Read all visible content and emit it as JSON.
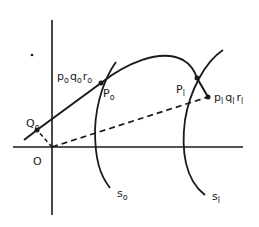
{
  "diagram": {
    "type": "geometric-construction",
    "axes": {
      "origin_label": "O"
    },
    "points": [
      {
        "id": "O",
        "label": "O",
        "x": 52,
        "y": 147
      },
      {
        "id": "Q0",
        "label": "Q",
        "sub": "o",
        "x": 37,
        "y": 130
      },
      {
        "id": "P0",
        "label": "P",
        "sub": "o",
        "x": 101,
        "y": 83
      },
      {
        "id": "P1",
        "label": "P",
        "sub": "l",
        "x": 197,
        "y": 78
      },
      {
        "id": "p1",
        "x": 208,
        "y": 97
      }
    ],
    "labels": {
      "O": "O",
      "Q0_main": "Q",
      "Q0_sub": "o",
      "P0_main": "P",
      "P0_sub": "o",
      "P1_main": "P",
      "P1_sub": "l",
      "p0q0r0": {
        "p": "p",
        "q": "q",
        "r": "r",
        "sub": "o"
      },
      "p1q1r1": {
        "p": "p",
        "q": "q",
        "r": "r",
        "sub": "l"
      },
      "s0_main": "s",
      "s0_sub": "o",
      "s1_main": "s",
      "s1_sub": "l"
    },
    "curves": [
      {
        "name": "trajectory",
        "style": "solid",
        "through": [
          "Q0",
          "P0",
          "P1",
          "p1"
        ]
      },
      {
        "name": "s0",
        "style": "solid",
        "through": [
          "P0"
        ]
      },
      {
        "name": "s1",
        "style": "solid",
        "through": [
          "P1"
        ]
      },
      {
        "name": "O-to-Q0",
        "style": "dashed"
      },
      {
        "name": "O-to-p1",
        "style": "dashed"
      }
    ],
    "colors": {
      "ink": "#1a1a1a",
      "background": "#ffffff"
    }
  }
}
